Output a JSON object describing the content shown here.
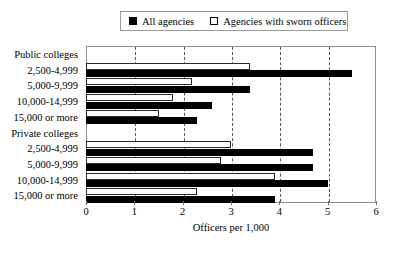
{
  "chart_data": {
    "type": "bar",
    "orientation": "horizontal",
    "title": "",
    "xlabel": "Officers per 1,000",
    "ylabel": "",
    "xlim": [
      0,
      6
    ],
    "xticks": [
      0,
      1,
      2,
      3,
      4,
      5,
      6
    ],
    "grid": "vertical-dashed",
    "legend_position": "top-center",
    "groups": [
      {
        "name": "Public colleges",
        "categories": [
          "2,500-4,999",
          "5,000-9,999",
          "10,000-14,999",
          "15,000 or more"
        ]
      },
      {
        "name": "Private colleges",
        "categories": [
          "2,500-4,999",
          "5,000-9,999",
          "10,000-14,999",
          "15,000 or more"
        ]
      }
    ],
    "categories": [
      "Public colleges",
      "2,500-4,999",
      "5,000-9,999",
      "10,000-14,999",
      "15,000 or more",
      "Private colleges",
      "2,500-4,999",
      "5,000-9,999",
      "10,000-14,999",
      "15,000 or more"
    ],
    "series": [
      {
        "name": "All agencies",
        "style": "filled",
        "color": "#000000",
        "values": [
          null,
          5.5,
          3.4,
          2.6,
          2.3,
          null,
          4.7,
          4.7,
          5.0,
          3.9
        ]
      },
      {
        "name": "Agencies with sworn officers",
        "style": "hollow",
        "color": "#ffffff",
        "values": [
          null,
          3.4,
          2.2,
          1.8,
          1.5,
          null,
          3.0,
          2.8,
          3.9,
          2.3
        ]
      }
    ]
  },
  "legend": {
    "entries": [
      {
        "label": "All agencies",
        "swatch": "filled-square"
      },
      {
        "label": "Agencies with sworn officers",
        "swatch": "hollow-square"
      }
    ]
  },
  "axis": {
    "x_title": "Officers per 1,000",
    "x_ticks": [
      "0",
      "1",
      "2",
      "3",
      "4",
      "5",
      "6"
    ]
  },
  "rows": [
    {
      "label": "Public colleges",
      "is_group": true,
      "filled": null,
      "hollow": null
    },
    {
      "label": "2,500-4,999",
      "is_group": false,
      "filled": 5.5,
      "hollow": 3.4
    },
    {
      "label": "5,000-9,999",
      "is_group": false,
      "filled": 3.4,
      "hollow": 2.2
    },
    {
      "label": "10,000-14,999",
      "is_group": false,
      "filled": 2.6,
      "hollow": 1.8
    },
    {
      "label": "15,000 or more",
      "is_group": false,
      "filled": 2.3,
      "hollow": 1.5
    },
    {
      "label": "Private colleges",
      "is_group": true,
      "filled": null,
      "hollow": null
    },
    {
      "label": "2,500-4,999",
      "is_group": false,
      "filled": 4.7,
      "hollow": 3.0
    },
    {
      "label": "5,000-9,999",
      "is_group": false,
      "filled": 4.7,
      "hollow": 2.8
    },
    {
      "label": "10,000-14,999",
      "is_group": false,
      "filled": 5.0,
      "hollow": 3.9
    },
    {
      "label": "15,000 or more",
      "is_group": false,
      "filled": 3.9,
      "hollow": 2.3
    }
  ]
}
